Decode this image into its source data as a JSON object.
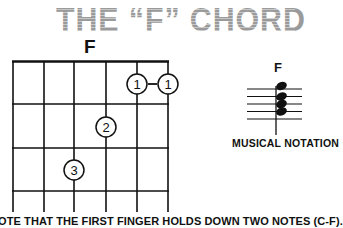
{
  "page": {
    "title": "THE “F” CHORD",
    "title_color": "#9a9a9a",
    "text_color": "#111111"
  },
  "chord_diagram": {
    "chord_name": "F",
    "strings": 6,
    "frets_shown": 4,
    "fingerings": [
      {
        "finger": "1",
        "string": 5,
        "fret": 1
      },
      {
        "finger": "1",
        "string": 6,
        "fret": 1
      },
      {
        "finger": "2",
        "string": 4,
        "fret": 2
      },
      {
        "finger": "3",
        "string": 3,
        "fret": 3
      }
    ],
    "barre_connector": "-"
  },
  "musical_notation": {
    "chord_name": "F",
    "label": "MUSICAL NOTATION",
    "noteheads": 4
  },
  "caption": {
    "text": "OTE THAT THE FIRST FINGER HOLDS DOWN TWO NOTES (C-F)."
  }
}
